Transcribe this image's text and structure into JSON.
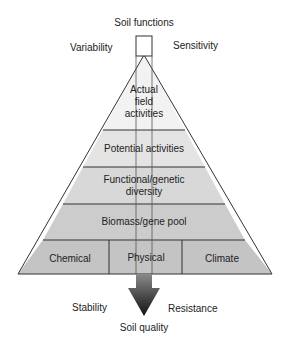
{
  "diagram": {
    "top_label": "Soil functions",
    "bottom_label": "Soil quality",
    "corners": {
      "top_left": "Variability",
      "top_right": "Sensitivity",
      "bottom_left": "Stability",
      "bottom_right": "Resistance"
    },
    "tiers": [
      {
        "label_lines": [
          "Actual",
          "field",
          "activities"
        ],
        "fill": "#f2f2f2"
      },
      {
        "label": "Potential activities",
        "fill": "#e4e4e4"
      },
      {
        "label_lines": [
          "Functional/genetic",
          "diversity"
        ],
        "fill": "#d8d8d8"
      },
      {
        "label": "Biomass/gene pool",
        "fill": "#cccccc"
      },
      {
        "cells": [
          "Chemical",
          "Physical",
          "Climate"
        ],
        "fill": "#c4c4c4"
      }
    ],
    "colors": {
      "line": "#333333",
      "arrow_top": "#8a8a8a",
      "arrow_bottom": "#111111"
    }
  }
}
